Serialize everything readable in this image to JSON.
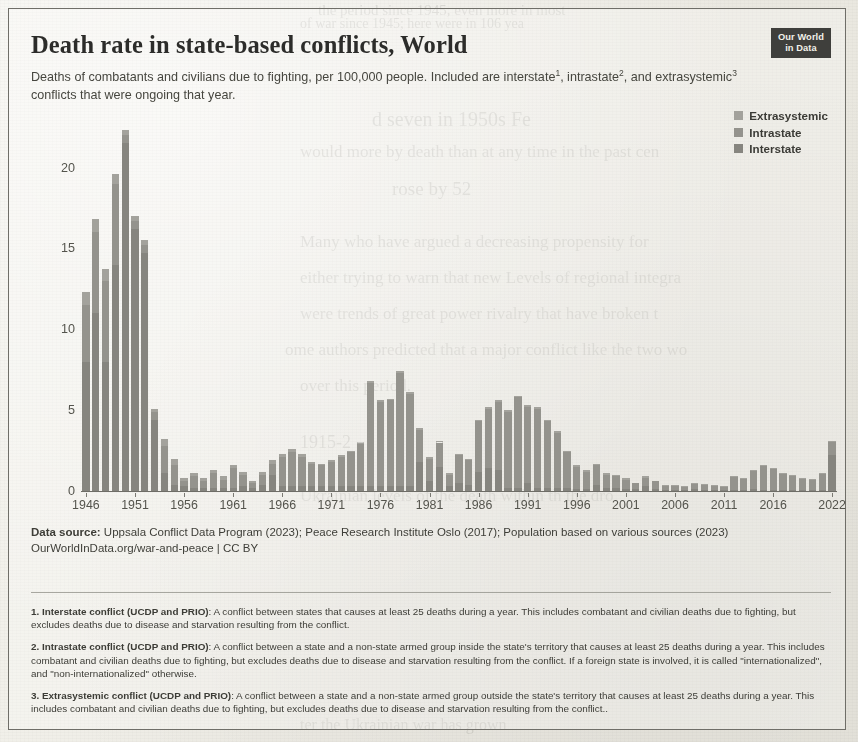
{
  "header": {
    "title": "Death rate in state-based conflicts, World",
    "subtitle_part1": "Deaths of combatants and civilians due to fighting, per 100,000 people. Included are interstate",
    "sup1": "1",
    "subtitle_part2": ", intrastate",
    "sup2": "2",
    "subtitle_part3": ", and extrasystemic",
    "sup3": "3",
    "subtitle_part4": " conflicts that were ongoing that year.",
    "logo_line1": "Our World",
    "logo_line2": "in Data"
  },
  "legend": {
    "items": [
      {
        "label": "Extrasystemic",
        "color": "#a3a29c"
      },
      {
        "label": "Intrastate",
        "color": "#94938d"
      },
      {
        "label": "Interstate",
        "color": "#86857f"
      }
    ]
  },
  "footer": {
    "data_source_label": "Data source:",
    "data_source_text": " Uppsala Conflict Data Program (2023); Peace Research Institute Oslo (2017); Population based on various sources (2023)",
    "link": "OurWorldInData.org/war-and-peace",
    "separator": " | ",
    "license": "CC BY"
  },
  "notes": [
    {
      "label": "1. Interstate conflict (UCDP and PRIO)",
      "text": ": A conflict between states that causes at least 25 deaths during a year. This includes combatant and civilian deaths due to fighting, but excludes deaths due to disease and starvation resulting from the conflict."
    },
    {
      "label": "2. Intrastate conflict (UCDP and PRIO)",
      "text": ": A conflict between a state and a non-state armed group inside the state's territory that causes at least 25 deaths during a year. This includes combatant and civilian deaths due to fighting, but excludes deaths due to disease and starvation resulting from the conflict. If a foreign state is involved, it is called \"internationalized\", and \"non-internationalized\" otherwise."
    },
    {
      "label": "3. Extrasystemic conflict (UCDP and PRIO)",
      "text": ": A conflict between a state and a non-state armed group outside the state's territory that causes at least 25 deaths during a year. This includes combatant and civilian deaths due to fighting, but excludes deaths due to disease and starvation resulting from the conflict.."
    }
  ],
  "bleed_through": [
    {
      "text": "the period since 1945, even more  in most",
      "x": 318,
      "y": 2,
      "size": 15
    },
    {
      "text": "of war since 1945; here were in 106 yea",
      "x": 300,
      "y": 16,
      "size": 14
    },
    {
      "text": "d seven in 1950s Fe",
      "x": 372,
      "y": 108,
      "size": 20
    },
    {
      "text": "would more by death than at any time in the past cen",
      "x": 300,
      "y": 142,
      "size": 17
    },
    {
      "text": "rose by 52",
      "x": 392,
      "y": 178,
      "size": 19
    },
    {
      "text": "Many who have argued a decreasing propensity for",
      "x": 300,
      "y": 232,
      "size": 17
    },
    {
      "text": "either trying to warn that new Levels of regional integra",
      "x": 300,
      "y": 268,
      "size": 17
    },
    {
      "text": "were trends of great power rivalry that have broken t",
      "x": 300,
      "y": 304,
      "size": 17
    },
    {
      "text": "ome authors predicted that a major conflict like the two wo",
      "x": 285,
      "y": 340,
      "size": 17
    },
    {
      "text": "over this period.",
      "x": 300,
      "y": 376,
      "size": 17
    },
    {
      "text": "1915-2",
      "x": 300,
      "y": 432,
      "size": 18
    },
    {
      "text": "Ukrainian levels of the death within th the dro",
      "x": 300,
      "y": 486,
      "size": 17
    },
    {
      "text": "ter the Ukrainian war has grown",
      "x": 300,
      "y": 716,
      "size": 16
    }
  ],
  "chart_data": {
    "type": "bar",
    "title": "Death rate in state-based conflicts, World",
    "subtitle": "Deaths of combatants and civilians due to fighting, per 100,000 people. Included are interstate, intrastate, and extrasystemic conflicts that were ongoing that year.",
    "xlabel": "",
    "ylabel": "Deaths per 100,000 people",
    "ylim": [
      0,
      23
    ],
    "yticks": [
      0,
      5,
      10,
      15,
      20
    ],
    "ytick_labels": [
      "0",
      "5",
      "10",
      "15",
      "20"
    ],
    "xticks": [
      1946,
      1951,
      1956,
      1961,
      1966,
      1971,
      1976,
      1981,
      1986,
      1991,
      1996,
      2001,
      2006,
      2011,
      2016,
      2022
    ],
    "xtick_labels": [
      "1946",
      "1951",
      "1956",
      "1961",
      "1966",
      "1971",
      "1976",
      "1981",
      "1986",
      "1991",
      "1996",
      "2001",
      "2006",
      "2011",
      "2016",
      "2022"
    ],
    "grid": false,
    "legend_position": "top-right",
    "stacked": true,
    "series_names": [
      "Interstate",
      "Intrastate",
      "Extrasystemic"
    ],
    "categories": [
      1946,
      1947,
      1948,
      1949,
      1950,
      1951,
      1952,
      1953,
      1954,
      1955,
      1956,
      1957,
      1958,
      1959,
      1960,
      1961,
      1962,
      1963,
      1964,
      1965,
      1966,
      1967,
      1968,
      1969,
      1970,
      1971,
      1972,
      1973,
      1974,
      1975,
      1976,
      1977,
      1978,
      1979,
      1980,
      1981,
      1982,
      1983,
      1984,
      1985,
      1986,
      1987,
      1988,
      1989,
      1990,
      1991,
      1992,
      1993,
      1994,
      1995,
      1996,
      1997,
      1998,
      1999,
      2000,
      2001,
      2002,
      2003,
      2004,
      2005,
      2006,
      2007,
      2008,
      2009,
      2010,
      2011,
      2012,
      2013,
      2014,
      2015,
      2016,
      2017,
      2018,
      2019,
      2020,
      2021,
      2022
    ],
    "values": [
      12.3,
      16.8,
      13.7,
      19.6,
      22.3,
      17.0,
      15.5,
      5.1,
      3.2,
      2.0,
      0.8,
      1.1,
      0.8,
      1.3,
      0.9,
      1.6,
      1.2,
      0.6,
      1.2,
      1.9,
      2.3,
      2.6,
      2.3,
      1.8,
      1.7,
      1.9,
      2.2,
      2.5,
      3.0,
      6.8,
      5.6,
      5.7,
      7.4,
      6.1,
      3.9,
      2.1,
      3.1,
      1.1,
      2.3,
      2.0,
      4.4,
      5.2,
      5.6,
      5.0,
      5.9,
      5.3,
      5.2,
      4.4,
      3.7,
      2.5,
      1.6,
      1.3,
      1.7,
      1.1,
      1.0,
      0.8,
      0.5,
      0.9,
      0.6,
      0.4,
      0.35,
      0.3,
      0.5,
      0.45,
      0.4,
      0.3,
      0.9,
      0.8,
      1.3,
      1.6,
      1.4,
      1.1,
      1.0,
      0.8,
      0.75,
      1.1,
      3.1
    ],
    "series": [
      {
        "name": "Interstate",
        "values": [
          8.0,
          11.0,
          8.0,
          14.0,
          21.5,
          16.2,
          14.7,
          4.4,
          1.1,
          0.4,
          0.3,
          0.2,
          0.2,
          0.2,
          0.2,
          0.2,
          0.3,
          0.2,
          0.4,
          1.0,
          0.3,
          0.3,
          0.3,
          0.3,
          0.3,
          0.3,
          0.3,
          0.3,
          0.3,
          0.3,
          0.3,
          0.3,
          0.3,
          0.3,
          1.8,
          0.6,
          1.5,
          0.3,
          0.5,
          0.4,
          1.2,
          1.4,
          1.3,
          0.2,
          0.2,
          0.5,
          0.2,
          0.2,
          0.2,
          0.2,
          0.1,
          0.1,
          0.4,
          0.2,
          0.2,
          0.1,
          0.1,
          0.3,
          0.1,
          0.05,
          0.05,
          0.05,
          0.1,
          0.05,
          0.05,
          0.05,
          0.05,
          0.05,
          0.1,
          0.05,
          0.05,
          0.05,
          0.05,
          0.05,
          0.05,
          0.05,
          2.2
        ]
      },
      {
        "name": "Intrastate",
        "values": [
          3.5,
          5.0,
          5.0,
          5.0,
          0.5,
          0.5,
          0.5,
          0.5,
          1.7,
          1.2,
          0.3,
          0.7,
          0.4,
          0.9,
          0.5,
          1.2,
          0.7,
          0.3,
          0.6,
          0.7,
          1.8,
          2.1,
          1.8,
          1.4,
          1.3,
          1.5,
          1.8,
          2.1,
          2.6,
          6.4,
          5.2,
          5.3,
          7.0,
          5.7,
          2.0,
          1.4,
          1.5,
          0.7,
          1.7,
          1.5,
          3.1,
          3.7,
          4.2,
          4.7,
          5.6,
          4.7,
          4.9,
          4.1,
          3.4,
          2.2,
          1.4,
          1.1,
          1.2,
          0.8,
          0.7,
          0.6,
          0.4,
          0.5,
          0.5,
          0.33,
          0.28,
          0.23,
          0.38,
          0.38,
          0.33,
          0.23,
          0.83,
          0.73,
          1.18,
          1.53,
          1.33,
          1.03,
          0.93,
          0.73,
          0.68,
          1.03,
          0.88
        ]
      },
      {
        "name": "Extrasystemic",
        "values": [
          0.8,
          0.8,
          0.7,
          0.6,
          0.3,
          0.3,
          0.3,
          0.2,
          0.4,
          0.4,
          0.2,
          0.2,
          0.2,
          0.2,
          0.2,
          0.2,
          0.2,
          0.1,
          0.2,
          0.2,
          0.2,
          0.2,
          0.2,
          0.1,
          0.1,
          0.1,
          0.1,
          0.1,
          0.1,
          0.1,
          0.1,
          0.1,
          0.1,
          0.1,
          0.1,
          0.1,
          0.1,
          0.1,
          0.1,
          0.1,
          0.1,
          0.1,
          0.1,
          0.1,
          0.1,
          0.1,
          0.1,
          0.1,
          0.1,
          0.1,
          0.1,
          0.1,
          0.1,
          0.1,
          0.1,
          0.1,
          0.0,
          0.1,
          0.0,
          0.02,
          0.02,
          0.02,
          0.02,
          0.02,
          0.02,
          0.02,
          0.02,
          0.02,
          0.02,
          0.02,
          0.02,
          0.02,
          0.02,
          0.02,
          0.02,
          0.02,
          0.02
        ]
      }
    ]
  }
}
